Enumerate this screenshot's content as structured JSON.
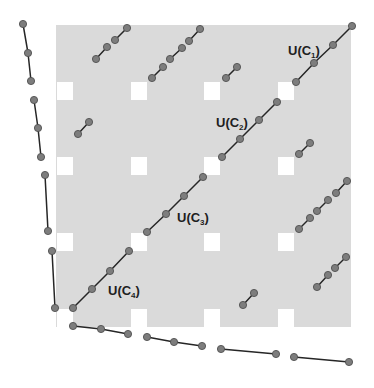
{
  "figure": {
    "colors": {
      "background": "#ffffff",
      "shaded_region": "#dadada",
      "line": "#262626",
      "dot_fill": "#7d7d7d",
      "dot_stroke": "#505050"
    },
    "shaded_region": {
      "x": 56,
      "y": 25,
      "width": 295,
      "height": 302
    },
    "holes": {
      "xs": [
        57,
        131,
        204,
        278
      ],
      "ys": [
        82,
        157,
        233,
        309
      ],
      "width": 16,
      "height": 18
    },
    "dot_radius": 3.6,
    "labels": [
      {
        "id": "uc1",
        "prefix": "U(C",
        "subscript": "1",
        "suffix": ")",
        "x": 288,
        "y": 55
      },
      {
        "id": "uc2",
        "prefix": "U(C",
        "subscript": "2",
        "suffix": ")",
        "x": 216,
        "y": 127
      },
      {
        "id": "uc3",
        "prefix": "U(C",
        "subscript": "3",
        "suffix": ")",
        "x": 177,
        "y": 222
      },
      {
        "id": "uc4",
        "prefix": "U(C",
        "subscript": "4",
        "suffix": ")",
        "x": 108,
        "y": 295
      }
    ],
    "diagonals": [
      {
        "id": "uc1",
        "points": [
          [
            296,
            82
          ],
          [
            314,
            63
          ],
          [
            333,
            45
          ],
          [
            352,
            26
          ]
        ]
      },
      {
        "id": "uc2",
        "points": [
          [
            222,
            157
          ],
          [
            240,
            139
          ],
          [
            259,
            120
          ],
          [
            277,
            102
          ]
        ]
      },
      {
        "id": "uc3",
        "points": [
          [
            147,
            232
          ],
          [
            166,
            214
          ],
          [
            184,
            196
          ],
          [
            203,
            177
          ]
        ]
      },
      {
        "id": "uc4",
        "points": [
          [
            73,
            308
          ],
          [
            92,
            289
          ],
          [
            110,
            271
          ],
          [
            129,
            251
          ]
        ]
      }
    ],
    "left_segments": [
      {
        "points": [
          [
            23,
            24
          ],
          [
            28,
            53
          ],
          [
            31,
            81
          ]
        ]
      },
      {
        "points": [
          [
            34,
            100
          ],
          [
            38,
            128
          ],
          [
            41,
            157
          ]
        ]
      },
      {
        "points": [
          [
            45,
            175
          ],
          [
            48,
            231
          ]
        ]
      },
      {
        "points": [
          [
            52,
            251
          ],
          [
            55,
            308
          ]
        ]
      }
    ],
    "bottom_segments": [
      {
        "points": [
          [
            73,
            326
          ],
          [
            101,
            329
          ],
          [
            128,
            334
          ]
        ]
      },
      {
        "points": [
          [
            147,
            337
          ],
          [
            174,
            342
          ],
          [
            202,
            346
          ]
        ]
      },
      {
        "points": [
          [
            221,
            349
          ],
          [
            276,
            354
          ]
        ]
      },
      {
        "points": [
          [
            294,
            357
          ],
          [
            349,
            362
          ]
        ]
      }
    ],
    "short_segments": [
      {
        "block": "r0c0",
        "points": [
          [
            96,
            59
          ],
          [
            107,
            47
          ]
        ]
      },
      {
        "block": "r0c0",
        "points": [
          [
            115,
            40
          ],
          [
            127,
            28
          ]
        ]
      },
      {
        "block": "r0c1",
        "points": [
          [
            152,
            78
          ],
          [
            163,
            67
          ]
        ]
      },
      {
        "block": "r0c1",
        "points": [
          [
            170,
            59
          ],
          [
            182,
            48
          ]
        ]
      },
      {
        "block": "r0c1",
        "points": [
          [
            189,
            41
          ],
          [
            200,
            29
          ]
        ]
      },
      {
        "block": "r0c2",
        "points": [
          [
            226,
            78
          ],
          [
            237,
            67
          ]
        ]
      },
      {
        "block": "r1c0",
        "points": [
          [
            78,
            134
          ],
          [
            89,
            122
          ]
        ]
      },
      {
        "block": "r1c3",
        "points": [
          [
            299,
            154
          ],
          [
            310,
            143
          ]
        ]
      },
      {
        "block": "r2c3",
        "points": [
          [
            299,
            229
          ],
          [
            310,
            218
          ]
        ]
      },
      {
        "block": "r2c3",
        "points": [
          [
            317,
            211
          ],
          [
            328,
            200
          ]
        ]
      },
      {
        "block": "r2c3",
        "points": [
          [
            336,
            193
          ],
          [
            347,
            181
          ]
        ]
      },
      {
        "block": "r3c2",
        "points": [
          [
            243,
            305
          ],
          [
            254,
            293
          ]
        ]
      },
      {
        "block": "r3c3",
        "points": [
          [
            317,
            287
          ],
          [
            328,
            275
          ]
        ]
      },
      {
        "block": "r3c3",
        "points": [
          [
            335,
            268
          ],
          [
            346,
            257
          ]
        ]
      }
    ]
  }
}
